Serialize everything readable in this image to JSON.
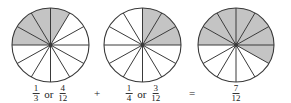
{
  "diagram": {
    "colors": {
      "shade": "#c4c4c4",
      "stroke": "#3a3a3a",
      "background": "#ffffff"
    },
    "slices_per_circle": 12,
    "circles": [
      {
        "id": "one-third",
        "cx": 50.5,
        "cy": 45,
        "rx": 38.5,
        "ry": 37,
        "shaded_slices": 4,
        "shaded_start_deg": 180,
        "shaded_end_deg": 60,
        "label": {
          "a_num": "1",
          "a_den": "3",
          "or": "or",
          "b_num": "4",
          "b_den": "12"
        }
      },
      {
        "id": "one-fourth",
        "cx": 142.5,
        "cy": 45,
        "rx": 38.5,
        "ry": 37,
        "shaded_slices": 3,
        "shaded_start_deg": 90,
        "shaded_end_deg": 0,
        "label": {
          "a_num": "1",
          "a_den": "4",
          "or": "or",
          "b_num": "3",
          "b_den": "12"
        }
      },
      {
        "id": "seven-twelfths",
        "cx": 236,
        "cy": 45,
        "rx": 38,
        "ry": 37,
        "shaded_slices": 7,
        "shaded_start_deg": 180,
        "shaded_end_deg": -30,
        "label": {
          "num": "7",
          "den": "12"
        }
      }
    ],
    "operators": {
      "plus": "+",
      "equals": "="
    }
  }
}
